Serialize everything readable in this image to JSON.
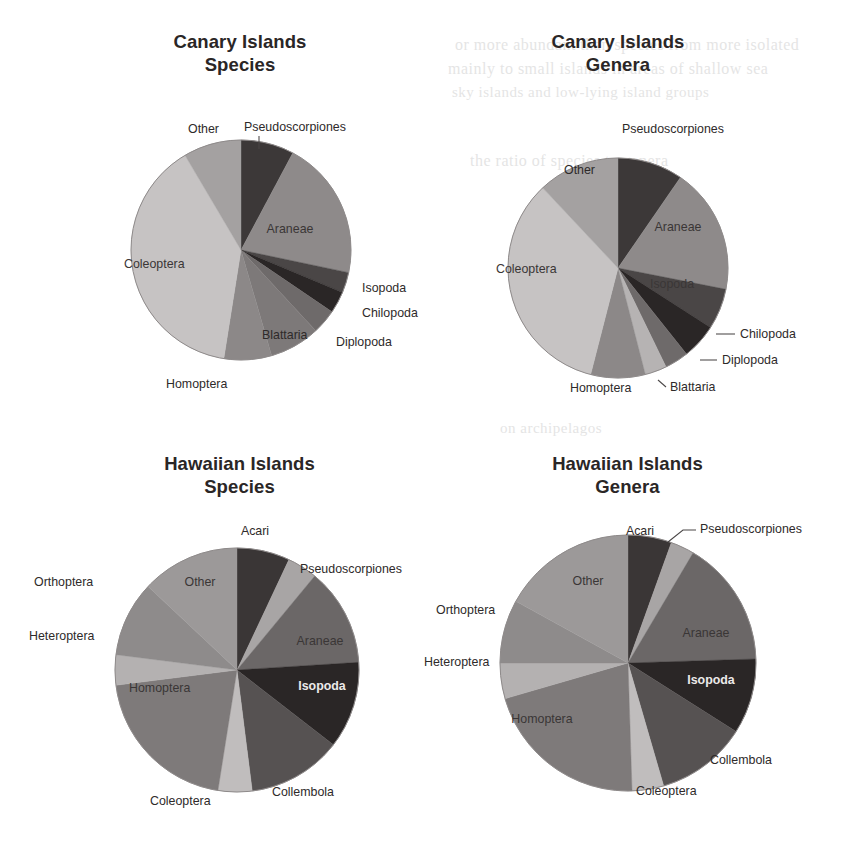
{
  "figure": {
    "bleed_text": [
      {
        "text": "or more abundant than species from more isolated",
        "x": 455,
        "y": 36,
        "size": 16
      },
      {
        "text": "mainly to small islands in areas of shallow sea",
        "x": 448,
        "y": 60,
        "size": 16
      },
      {
        "text": "sky islands and low-lying island groups",
        "x": 452,
        "y": 84,
        "size": 15
      },
      {
        "text": "the ratio of species to genera",
        "x": 470,
        "y": 152,
        "size": 16
      },
      {
        "text": "on archipelagos",
        "x": 500,
        "y": 420,
        "size": 15
      }
    ]
  },
  "charts": [
    {
      "id": "canary-species",
      "title": "Canary Islands\nSpecies",
      "type": "pie",
      "start_angle_deg": 0,
      "categories": [
        "Pseudoscorpiones",
        "Araneae",
        "Isopoda",
        "Chilopoda",
        "Diplopoda",
        "Blattaria",
        "Homoptera",
        "Coleoptera",
        "Other"
      ],
      "values": [
        7.8,
        20.5,
        3.0,
        3.2,
        3.6,
        7.4,
        7.0,
        39.0,
        8.5
      ],
      "colors": [
        "#3c3838",
        "#8e8a8a",
        "#4a4646",
        "#2a2626",
        "#6e6a6a",
        "#7d7979",
        "#8c8888",
        "#c6c3c3",
        "#a4a1a1"
      ],
      "labels": [
        {
          "text": "Pseudoscorpiones",
          "x": 244,
          "y": 131,
          "anchor": "start",
          "leader": [
            [
              259,
              136
            ],
            [
              259,
              149
            ]
          ],
          "inside": false
        },
        {
          "text": "Araneae",
          "x": 290,
          "y": 233,
          "anchor": "middle",
          "leader": null,
          "inside": true,
          "style": "inside-on-gray"
        },
        {
          "text": "Isopoda",
          "x": 362,
          "y": 292,
          "anchor": "start",
          "leader": null,
          "inside": false
        },
        {
          "text": "Chilopoda",
          "x": 362,
          "y": 317,
          "anchor": "start",
          "leader": null,
          "inside": false
        },
        {
          "text": "Diplopoda",
          "x": 336,
          "y": 346,
          "anchor": "start",
          "leader": null,
          "inside": false
        },
        {
          "text": "Blattaria",
          "x": 262,
          "y": 339,
          "anchor": "start",
          "leader": null,
          "inside": false
        },
        {
          "text": "Homoptera",
          "x": 166,
          "y": 388,
          "anchor": "start",
          "leader": null,
          "inside": false
        },
        {
          "text": "Coleoptera",
          "x": 124,
          "y": 268,
          "anchor": "start",
          "leader": null,
          "inside": true,
          "style": "inside-on-gray"
        },
        {
          "text": "Other",
          "x": 188,
          "y": 133,
          "anchor": "start",
          "leader": null,
          "inside": false
        }
      ]
    },
    {
      "id": "canary-genera",
      "title": "Canary Islands\nGenera",
      "type": "pie",
      "start_angle_deg": 0,
      "categories": [
        "Pseudoscorpiones",
        "Araneae",
        "Isopoda",
        "Chilopoda",
        "Diplopoda",
        "Blattaria",
        "Homoptera",
        "Coleoptera",
        "Other"
      ],
      "values": [
        9.6,
        18.5,
        6.0,
        5.2,
        3.5,
        3.2,
        8.0,
        34.0,
        12.0
      ],
      "colors": [
        "#3c3838",
        "#8e8a8a",
        "#4a4646",
        "#2a2626",
        "#6e6a6a",
        "#b6b3b3",
        "#8c8888",
        "#c6c3c3",
        "#a4a1a1"
      ],
      "labels": [
        {
          "text": "Pseudoscorpiones",
          "x": 622,
          "y": 133,
          "anchor": "start",
          "leader": null,
          "inside": false
        },
        {
          "text": "Araneae",
          "x": 678,
          "y": 231,
          "anchor": "middle",
          "leader": null,
          "inside": true,
          "style": "inside-on-gray"
        },
        {
          "text": "Isopoda",
          "x": 672,
          "y": 288,
          "anchor": "middle",
          "leader": null,
          "inside": true,
          "style": "inside-on-gray"
        },
        {
          "text": "Chilopoda",
          "x": 740,
          "y": 338,
          "anchor": "start",
          "leader": [
            [
              716,
              334
            ],
            [
              735,
              334
            ]
          ],
          "inside": false
        },
        {
          "text": "Diplopoda",
          "x": 722,
          "y": 364,
          "anchor": "start",
          "leader": [
            [
              700,
              360
            ],
            [
              717,
              360
            ]
          ],
          "inside": false
        },
        {
          "text": "Blattaria",
          "x": 670,
          "y": 391,
          "anchor": "start",
          "leader": [
            [
              658,
              380
            ],
            [
              666,
              387
            ]
          ],
          "inside": false
        },
        {
          "text": "Homoptera",
          "x": 570,
          "y": 392,
          "anchor": "start",
          "leader": null,
          "inside": false
        },
        {
          "text": "Coleoptera",
          "x": 496,
          "y": 273,
          "anchor": "start",
          "leader": null,
          "inside": true,
          "style": "inside-on-gray"
        },
        {
          "text": "Other",
          "x": 564,
          "y": 174,
          "anchor": "start",
          "leader": null,
          "inside": false
        }
      ]
    },
    {
      "id": "hawaiian-species",
      "title": "Hawaiian Islands\nSpecies",
      "type": "pie",
      "start_angle_deg": 0,
      "categories": [
        "Acari",
        "Pseudoscorpiones",
        "Araneae",
        "Isopoda",
        "Collembola",
        "Coleoptera",
        "Homoptera",
        "Heteroptera",
        "Orthoptera",
        "Other"
      ],
      "values": [
        7.0,
        4.0,
        13.0,
        11.5,
        12.5,
        4.5,
        20.5,
        4.0,
        10.0,
        13.0
      ],
      "colors": [
        "#3a3636",
        "#a8a5a5",
        "#6b6767",
        "#2a2626",
        "#565252",
        "#c0bdbd",
        "#7e7a7a",
        "#b4b1b1",
        "#8e8b8b",
        "#9c9999"
      ],
      "labels": [
        {
          "text": "Acari",
          "x": 255,
          "y": 535,
          "anchor": "middle",
          "leader": null,
          "inside": false
        },
        {
          "text": "Pseudoscorpiones",
          "x": 300,
          "y": 573,
          "anchor": "start",
          "leader": null,
          "inside": false
        },
        {
          "text": "Araneae",
          "x": 320,
          "y": 645,
          "anchor": "middle",
          "leader": null,
          "inside": true,
          "style": "inside-on-gray"
        },
        {
          "text": "Isopoda",
          "x": 322,
          "y": 690,
          "anchor": "middle",
          "leader": null,
          "inside": true,
          "style": "inside-dark"
        },
        {
          "text": "Collembola",
          "x": 272,
          "y": 796,
          "anchor": "start",
          "leader": null,
          "inside": false
        },
        {
          "text": "Coleoptera",
          "x": 150,
          "y": 805,
          "anchor": "start",
          "leader": null,
          "inside": false
        },
        {
          "text": "Homoptera",
          "x": 129,
          "y": 692,
          "anchor": "start",
          "leader": null,
          "inside": true,
          "style": "inside-on-gray"
        },
        {
          "text": "Heteroptera",
          "x": 29,
          "y": 640,
          "anchor": "start",
          "leader": null,
          "inside": false
        },
        {
          "text": "Orthoptera",
          "x": 34,
          "y": 586,
          "anchor": "start",
          "leader": null,
          "inside": false
        },
        {
          "text": "Other",
          "x": 200,
          "y": 586,
          "anchor": "middle",
          "leader": null,
          "inside": true,
          "style": "inside-on-gray"
        }
      ]
    },
    {
      "id": "hawaiian-genera",
      "title": "Hawaiian Islands\nGenera",
      "type": "pie",
      "start_angle_deg": 0,
      "categories": [
        "Acari",
        "Pseudoscorpiones",
        "Araneae",
        "Isopoda",
        "Collembola",
        "Coleoptera",
        "Homoptera",
        "Heteroptera",
        "Orthoptera",
        "Other"
      ],
      "values": [
        5.5,
        3.0,
        16.0,
        9.5,
        11.5,
        4.0,
        21.0,
        4.5,
        8.0,
        17.0
      ],
      "colors": [
        "#3a3636",
        "#a8a5a5",
        "#6b6767",
        "#2a2626",
        "#565252",
        "#c0bdbd",
        "#7e7a7a",
        "#b4b1b1",
        "#8e8b8b",
        "#9c9999"
      ],
      "labels": [
        {
          "text": "Acari",
          "x": 640,
          "y": 535,
          "anchor": "middle",
          "leader": null,
          "inside": false
        },
        {
          "text": "Pseudoscorpiones",
          "x": 700,
          "y": 533,
          "anchor": "start",
          "leader": [
            [
              668,
              542
            ],
            [
              683,
              530
            ],
            [
              696,
              530
            ]
          ],
          "inside": false
        },
        {
          "text": "Araneae",
          "x": 706,
          "y": 637,
          "anchor": "middle",
          "leader": null,
          "inside": true,
          "style": "inside-on-gray"
        },
        {
          "text": "Isopoda",
          "x": 711,
          "y": 684,
          "anchor": "middle",
          "leader": null,
          "inside": true,
          "style": "inside-dark"
        },
        {
          "text": "Collembola",
          "x": 710,
          "y": 764,
          "anchor": "start",
          "leader": null,
          "inside": false
        },
        {
          "text": "Coleoptera",
          "x": 636,
          "y": 795,
          "anchor": "start",
          "leader": null,
          "inside": false
        },
        {
          "text": "Homoptera",
          "x": 542,
          "y": 723,
          "anchor": "middle",
          "leader": null,
          "inside": true,
          "style": "inside-on-gray"
        },
        {
          "text": "Heteroptera",
          "x": 424,
          "y": 666,
          "anchor": "start",
          "leader": null,
          "inside": false
        },
        {
          "text": "Orthoptera",
          "x": 436,
          "y": 614,
          "anchor": "start",
          "leader": null,
          "inside": false
        },
        {
          "text": "Other",
          "x": 588,
          "y": 585,
          "anchor": "middle",
          "leader": null,
          "inside": true,
          "style": "inside-on-gray"
        }
      ]
    }
  ],
  "chart_data": [
    {
      "type": "pie",
      "title": "Canary Islands Species",
      "categories": [
        "Pseudoscorpiones",
        "Araneae",
        "Isopoda",
        "Chilopoda",
        "Diplopoda",
        "Blattaria",
        "Homoptera",
        "Coleoptera",
        "Other"
      ],
      "values": [
        7.8,
        20.5,
        3.0,
        3.2,
        3.6,
        7.4,
        7.0,
        39.0,
        8.5
      ],
      "units": "percent",
      "legend": "none (direct slice labels)",
      "grid": false
    },
    {
      "type": "pie",
      "title": "Canary Islands Genera",
      "categories": [
        "Pseudoscorpiones",
        "Araneae",
        "Isopoda",
        "Chilopoda",
        "Diplopoda",
        "Blattaria",
        "Homoptera",
        "Coleoptera",
        "Other"
      ],
      "values": [
        9.6,
        18.5,
        6.0,
        5.2,
        3.5,
        3.2,
        8.0,
        34.0,
        12.0
      ],
      "units": "percent",
      "legend": "none (direct slice labels)",
      "grid": false
    },
    {
      "type": "pie",
      "title": "Hawaiian Islands Species",
      "categories": [
        "Acari",
        "Pseudoscorpiones",
        "Araneae",
        "Isopoda",
        "Collembola",
        "Coleoptera",
        "Homoptera",
        "Heteroptera",
        "Orthoptera",
        "Other"
      ],
      "values": [
        7.0,
        4.0,
        13.0,
        11.5,
        12.5,
        4.5,
        20.5,
        4.0,
        10.0,
        13.0
      ],
      "units": "percent",
      "legend": "none (direct slice labels)",
      "grid": false
    },
    {
      "type": "pie",
      "title": "Hawaiian Islands Genera",
      "categories": [
        "Acari",
        "Pseudoscorpiones",
        "Araneae",
        "Isopoda",
        "Collembola",
        "Coleoptera",
        "Homoptera",
        "Heteroptera",
        "Orthoptera",
        "Other"
      ],
      "values": [
        5.5,
        3.0,
        16.0,
        9.5,
        11.5,
        4.0,
        21.0,
        4.5,
        8.0,
        17.0
      ],
      "units": "percent",
      "legend": "none (direct slice labels)",
      "grid": false
    }
  ],
  "geometry": {
    "pies": [
      {
        "cx": 241,
        "cy": 250,
        "r": 110
      },
      {
        "cx": 618,
        "cy": 268,
        "r": 110
      },
      {
        "cx": 237,
        "cy": 670,
        "r": 122
      },
      {
        "cx": 628,
        "cy": 663,
        "r": 128
      }
    ],
    "titles": [
      {
        "x": 140,
        "y": 30,
        "w": 200
      },
      {
        "x": 518,
        "y": 30,
        "w": 200
      },
      {
        "x": 132,
        "y": 452,
        "w": 215
      },
      {
        "x": 520,
        "y": 452,
        "w": 215
      }
    ]
  }
}
